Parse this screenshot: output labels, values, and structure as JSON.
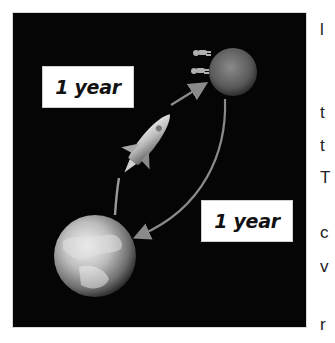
{
  "figure": {
    "labels": {
      "outbound": "1 year",
      "return": "1 year"
    },
    "objects": [
      "earth",
      "mars",
      "rocket",
      "astronauts",
      "outbound-arrow",
      "return-arrow"
    ],
    "colors": {
      "background": "#050505",
      "label_box": "#ffffff",
      "label_text": "#111111",
      "arrow": "#8a8a8a"
    }
  },
  "clipped_text": {
    "lines": [
      {
        "text": "l",
        "top": 20
      },
      {
        "text": "t",
        "top": 103
      },
      {
        "text": "t",
        "top": 136
      },
      {
        "text": "T",
        "top": 168
      },
      {
        "text": "c",
        "top": 223
      },
      {
        "text": "v",
        "top": 257
      },
      {
        "text": "r",
        "top": 315
      }
    ]
  }
}
